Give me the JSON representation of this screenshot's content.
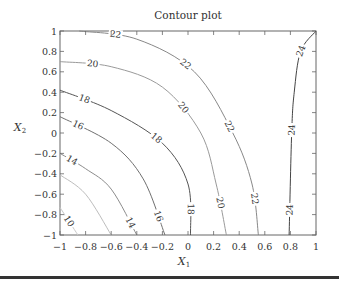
{
  "chart_data": {
    "type": "contour",
    "title": "Contour plot",
    "xlabel": "X1",
    "ylabel": "X2",
    "xlim": [
      -1,
      1
    ],
    "ylim": [
      -1,
      1
    ],
    "x_ticks": [
      "-1",
      "-0.8",
      "-0.6",
      "-0.4",
      "-0.2",
      "0",
      "0.2",
      "0.4",
      "0.6",
      "0.8",
      "1"
    ],
    "y_ticks": [
      "1",
      "0.8",
      "0.6",
      "0.4",
      "0.2",
      "0",
      "-0.2",
      "-0.4",
      "-0.6",
      "-0.8",
      "-1"
    ],
    "grid": false,
    "contour_levels": [
      10,
      12,
      14,
      16,
      18,
      20,
      22,
      24
    ],
    "contours": [
      {
        "level": 10,
        "labels": [
          "10"
        ],
        "points": [
          [
            -1.0,
            -0.73
          ],
          [
            -0.86,
            -1.0
          ]
        ]
      },
      {
        "level": 12,
        "labels": [],
        "points": [
          [
            -1.0,
            -0.41
          ],
          [
            -0.8,
            -0.6
          ],
          [
            -0.6,
            -1.0
          ]
        ]
      },
      {
        "level": 14,
        "labels": [
          "14",
          "14"
        ],
        "points": [
          [
            -1.0,
            -0.2
          ],
          [
            -0.8,
            -0.35
          ],
          [
            -0.6,
            -0.55
          ],
          [
            -0.4,
            -1.0
          ]
        ]
      },
      {
        "level": 16,
        "labels": [
          "16",
          "16"
        ],
        "points": [
          [
            -1.0,
            0.16
          ],
          [
            -0.6,
            -0.1
          ],
          [
            -0.35,
            -0.45
          ],
          [
            -0.18,
            -1.0
          ]
        ]
      },
      {
        "level": 18,
        "labels": [
          "18",
          "18",
          "18"
        ],
        "points": [
          [
            -1.0,
            0.42
          ],
          [
            -0.6,
            0.22
          ],
          [
            -0.2,
            -0.1
          ],
          [
            0.0,
            -0.5
          ],
          [
            0.02,
            -1.0
          ]
        ]
      },
      {
        "level": 20,
        "labels": [
          "20",
          "20",
          "20"
        ],
        "points": [
          [
            -1.0,
            0.7
          ],
          [
            -0.6,
            0.65
          ],
          [
            -0.2,
            0.45
          ],
          [
            0.1,
            0.0
          ],
          [
            0.22,
            -0.5
          ],
          [
            0.3,
            -1.0
          ]
        ]
      },
      {
        "level": 22,
        "labels": [
          "22",
          "22",
          "22",
          "22"
        ],
        "points": [
          [
            -0.85,
            1.0
          ],
          [
            -0.4,
            0.92
          ],
          [
            0.05,
            0.6
          ],
          [
            0.35,
            0.0
          ],
          [
            0.5,
            -0.5
          ],
          [
            0.55,
            -1.0
          ]
        ]
      },
      {
        "level": 24,
        "labels": [
          "24",
          "24",
          "24"
        ],
        "points": [
          [
            1.0,
            1.0
          ],
          [
            0.88,
            0.8
          ],
          [
            0.83,
            0.4
          ],
          [
            0.81,
            0.0
          ],
          [
            0.79,
            -1.0
          ]
        ]
      }
    ]
  },
  "labels": {
    "title": "Contour plot",
    "xlabel_main": "X",
    "xlabel_sub": "1",
    "ylabel_main": "X",
    "ylabel_sub": "2"
  }
}
